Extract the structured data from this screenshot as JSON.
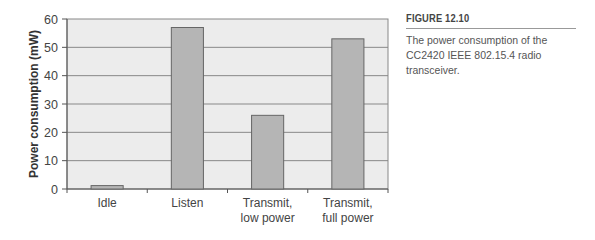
{
  "chart_data": {
    "type": "bar",
    "title": "",
    "xlabel": "",
    "ylabel": "Power consumption (mW)",
    "ylim": [
      0,
      60
    ],
    "yticks": [
      0,
      10,
      20,
      30,
      40,
      50,
      60
    ],
    "grid": true,
    "categories": [
      "Idle",
      "Listen",
      "Transmit, low power",
      "Transmit, full power"
    ],
    "category_lines": [
      [
        "Idle"
      ],
      [
        "Listen"
      ],
      [
        "Transmit,",
        "low power"
      ],
      [
        "Transmit,",
        "full power"
      ]
    ],
    "values": [
      1.2,
      57,
      26,
      53
    ],
    "colors": {
      "bar": "#b5b5b5",
      "bar_edge": "#666666",
      "plot_bg": "#ececec",
      "grid": "#888888"
    }
  },
  "caption": {
    "label": "FIGURE 12.10",
    "text": "The power consumption of the CC2420 IEEE 802.15.4 radio transceiver."
  }
}
